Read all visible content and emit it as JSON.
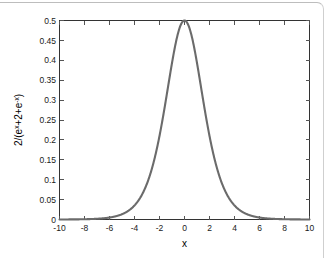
{
  "figure": {
    "background_color": "#ffffff",
    "frame_color": "#bdbdbd"
  },
  "chart_data": {
    "type": "line",
    "title": "",
    "xlabel": "x",
    "ylabel": "2/(e^x+2+e^-x)",
    "ylabel_parts": {
      "prefix": "2/(e",
      "sup1": "x",
      "middle": "+2+e",
      "sup2": "-x",
      "suffix": ")"
    },
    "xlim": [
      -10,
      10
    ],
    "ylim": [
      0,
      0.5
    ],
    "grid": false,
    "legend": null,
    "line_color": "#6b6b6b",
    "line_width": 2.1,
    "xticks": [
      -10,
      -8,
      -6,
      -4,
      -2,
      0,
      2,
      4,
      6,
      8,
      10
    ],
    "xticklabels": [
      "-10",
      "-8",
      "-6",
      "-4",
      "-2",
      "0",
      "2",
      "4",
      "6",
      "8",
      "10"
    ],
    "yticks": [
      0,
      0.05,
      0.1,
      0.15,
      0.2,
      0.25,
      0.3,
      0.35,
      0.4,
      0.45,
      0.5
    ],
    "yticklabels": [
      "0",
      "0.05",
      "0.1",
      "0.15",
      "0.2",
      "0.25",
      "0.3",
      "0.35",
      "0.4",
      "0.45",
      "0.5"
    ],
    "series": [
      {
        "name": "2/(e^x+2+e^-x)",
        "x": [
          -10,
          -9.5,
          -9,
          -8.5,
          -8,
          -7.5,
          -7,
          -6.5,
          -6,
          -5.5,
          -5,
          -4.5,
          -4,
          -3.5,
          -3,
          -2.75,
          -2.5,
          -2.25,
          -2,
          -1.75,
          -1.5,
          -1.25,
          -1,
          -0.75,
          -0.5,
          -0.25,
          0,
          0.25,
          0.5,
          0.75,
          1,
          1.25,
          1.5,
          1.75,
          2,
          2.25,
          2.5,
          2.75,
          3,
          3.5,
          4,
          4.5,
          5,
          5.5,
          6,
          6.5,
          7,
          7.5,
          8,
          8.5,
          9,
          9.5,
          10
        ],
        "y": [
          9.08e-05,
          0.0001497,
          0.0002468,
          0.0004067,
          0.00067,
          0.0011033,
          0.0018156,
          0.0029857,
          0.0049,
          0.0080236,
          0.0130931,
          0.0212423,
          0.0341337,
          0.0540222,
          0.0831727,
          0.1011789,
          0.1211874,
          0.1427104,
          0.1649948,
          0.1870893,
          0.2079702,
          0.2266462,
          0.2422917,
          0.2543438,
          0.2624781,
          0.2666568,
          0.2670555,
          0.2666568,
          0.2624781,
          0.2543438,
          0.2422917,
          0.2266462,
          0.2079702,
          0.1870893,
          0.1649948,
          0.1427104,
          0.1211874,
          0.1011789,
          0.0831727,
          0.0540222,
          0.0341337,
          0.0212423,
          0.0130931,
          0.0080236,
          0.0049,
          0.0029857,
          0.0018156,
          0.0011033,
          0.00067,
          0.0004067,
          0.0002468,
          0.0001497,
          9.08e-05
        ],
        "peak_x": 0,
        "peak_y": 0.5
      }
    ]
  }
}
